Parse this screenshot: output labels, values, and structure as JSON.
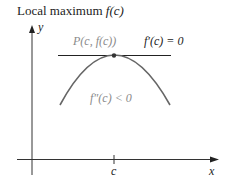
{
  "title": {
    "text": "Local maximum",
    "func": "f(c)"
  },
  "diagram": {
    "axes": {
      "x_label": "x",
      "y_label": "y",
      "tick_label": "c"
    },
    "point_label": "P(c, f(c))",
    "tangent_label": "f′(c) = 0",
    "concavity_label": "f″(c) < 0",
    "colors": {
      "axis": "#333333",
      "curve": "#666666",
      "tangent": "#222222",
      "point_label": "#8a8a8a"
    }
  }
}
